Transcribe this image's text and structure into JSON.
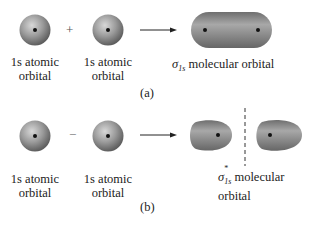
{
  "panel_a": {
    "atom1_label_line1": "1s atomic",
    "atom1_label_line2": "orbital",
    "operator": "+",
    "atom2_label_line1": "1s atomic",
    "atom2_label_line2": "orbital",
    "result_symbol": "σ",
    "result_subscript": "1s",
    "result_superscript": "",
    "result_text": " molecular orbital",
    "caption": "(a)"
  },
  "panel_b": {
    "atom1_label_line1": "1s atomic",
    "atom1_label_line2": "orbital",
    "operator": "−",
    "atom2_label_line1": "1s atomic",
    "atom2_label_line2": "orbital",
    "result_symbol": "σ",
    "result_subscript": "1s",
    "result_superscript": "*",
    "result_text": " molecular orbital",
    "caption": "(b)"
  },
  "colors": {
    "orbital_gray": "#8a8a8a",
    "nucleus": "#111111"
  }
}
